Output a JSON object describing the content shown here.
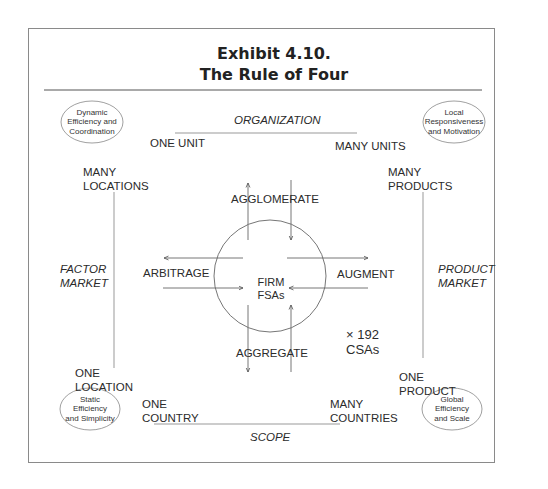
{
  "title": {
    "line1": "Exhibit 4.10.",
    "line2": "The Rule of Four"
  },
  "axes": {
    "top": "ORGANIZATION",
    "bottom": "SCOPE",
    "left": [
      "FACTOR",
      "MARKET"
    ],
    "right": [
      "PRODUCT",
      "MARKET"
    ]
  },
  "poles": {
    "one_unit": "ONE UNIT",
    "many_units": "MANY UNITS",
    "many_locations": [
      "MANY",
      "LOCATIONS"
    ],
    "one_location": [
      "ONE",
      "LOCATION"
    ],
    "many_products": [
      "MANY",
      "PRODUCTS"
    ],
    "one_product": [
      "ONE",
      "PRODUCT"
    ],
    "one_country": [
      "ONE",
      "COUNTRY"
    ],
    "many_countries": [
      "MANY",
      "COUNTRIES"
    ]
  },
  "corners": {
    "top_left": [
      "Dynamic",
      "Efficiency and",
      "Coordination"
    ],
    "top_right": [
      "Local",
      "Responsiveness",
      "and Motivation"
    ],
    "bottom_left": [
      "Static",
      "Efficiency",
      "and Simplicity"
    ],
    "bottom_right": [
      "Global",
      "Efficiency",
      "and Scale"
    ]
  },
  "center": {
    "line1": "FIRM",
    "line2": "FSAs"
  },
  "actions": {
    "top": "AGGLOMERATE",
    "bottom": "AGGREGATE",
    "left": "ARBITRAGE",
    "right": "AUGMENT"
  },
  "csa": {
    "line1": "× 192",
    "line2": "CSAs"
  }
}
